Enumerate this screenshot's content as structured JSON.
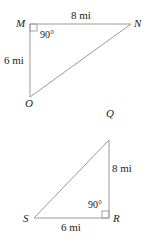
{
  "triangles": [
    {
      "id": "MNO",
      "vertices": {
        "M": {
          "label": "M",
          "x": 30,
          "y": 24
        },
        "N": {
          "label": "N",
          "x": 131,
          "y": 24
        },
        "O": {
          "label": "O",
          "x": 30,
          "y": 97
        }
      },
      "sides": {
        "MN": "8 mi",
        "MO": "6 mi"
      },
      "right_angle": {
        "vertex": "M",
        "label": "90°"
      }
    },
    {
      "id": "QRS",
      "vertices": {
        "Q": {
          "label": "Q",
          "x": 109,
          "y": 140
        },
        "R": {
          "label": "R",
          "x": 109,
          "y": 218
        },
        "S": {
          "label": "S",
          "x": 34,
          "y": 218
        }
      },
      "sides": {
        "QR": "8 mi",
        "SR": "6 mi"
      },
      "right_angle": {
        "vertex": "R",
        "label": "90°"
      }
    }
  ],
  "colors": {
    "edge": "#9a9a9a",
    "text": "#222222",
    "background": "#ffffff"
  }
}
